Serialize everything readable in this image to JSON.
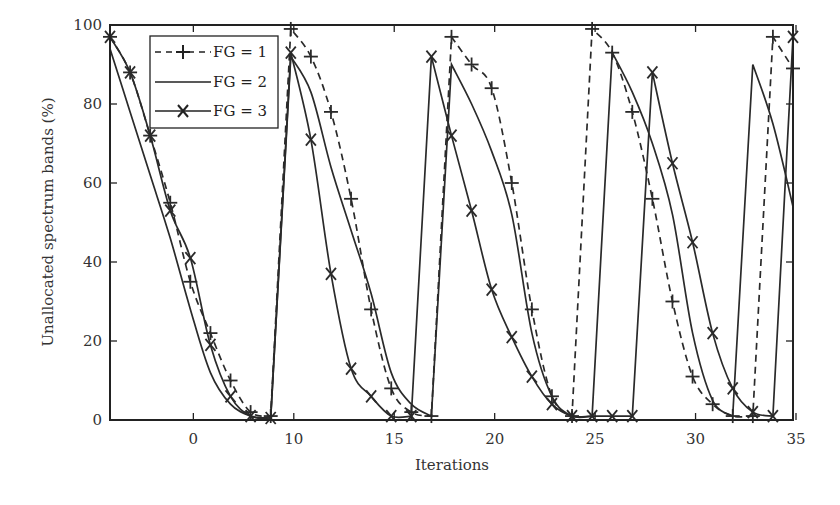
{
  "chart_data": {
    "type": "line",
    "title": "",
    "xlabel": "Iterations",
    "ylabel": "Unallocated spectrum bands (%)",
    "xlim": [
      1,
      35
    ],
    "ylim": [
      0,
      100
    ],
    "grid": false,
    "legend_position": "upper-left",
    "x_ticks": [
      {
        "pos": 5,
        "label": "0"
      },
      {
        "pos": 10,
        "label": "10"
      },
      {
        "pos": 15,
        "label": "15"
      },
      {
        "pos": 20,
        "label": "20"
      },
      {
        "pos": 25,
        "label": "25"
      },
      {
        "pos": 30,
        "label": "30"
      },
      {
        "pos": 35,
        "label": "35"
      }
    ],
    "y_ticks": [
      0,
      20,
      40,
      60,
      80,
      100
    ],
    "x": [
      1,
      2,
      3,
      4,
      5,
      6,
      7,
      8,
      9,
      10,
      11,
      12,
      13,
      14,
      15,
      16,
      17,
      18,
      19,
      20,
      21,
      22,
      23,
      24,
      25,
      26,
      27,
      28,
      29,
      30,
      31,
      32,
      33,
      34,
      35
    ],
    "series": [
      {
        "name": "FG = 1",
        "style": "dashed",
        "marker": "plus",
        "values": [
          97,
          88,
          72,
          55,
          35,
          22,
          10,
          2,
          1,
          99,
          92,
          78,
          56,
          28,
          8,
          2,
          1,
          97,
          90,
          84,
          60,
          28,
          6,
          1,
          99,
          93,
          78,
          56,
          30,
          11,
          4,
          1,
          1,
          97,
          89
        ]
      },
      {
        "name": "FG = 2",
        "style": "solid",
        "marker": "none",
        "values": [
          94,
          78,
          62,
          46,
          28,
          12,
          4,
          1,
          0.5,
          92,
          83,
          64,
          48,
          32,
          12,
          4,
          1,
          90,
          80,
          68,
          52,
          22,
          6,
          1,
          1,
          93,
          83,
          70,
          52,
          22,
          5,
          1,
          90,
          75,
          54
        ]
      },
      {
        "name": "FG = 3",
        "style": "solid",
        "marker": "cross",
        "values": [
          97,
          88,
          72,
          53,
          41,
          19,
          6,
          1,
          0.5,
          93,
          71,
          37,
          13,
          6,
          1,
          1,
          92,
          72,
          53,
          33,
          21,
          11,
          4,
          1,
          1,
          1,
          1,
          88,
          65,
          45,
          22,
          8,
          2,
          1,
          97
        ]
      }
    ]
  },
  "legend": {
    "items": [
      {
        "label": "FG = 1"
      },
      {
        "label": "FG = 2"
      },
      {
        "label": "FG = 3"
      }
    ]
  },
  "axes": {
    "xlabel": "Iterations",
    "ylabel": "Unallocated spectrum bands (%)"
  },
  "colors": {
    "line": "#2a2a2a",
    "axis": "#222222",
    "background": "#ffffff"
  }
}
